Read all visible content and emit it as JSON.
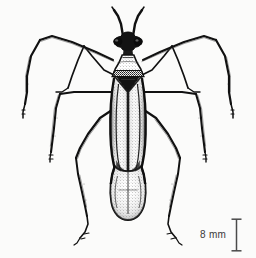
{
  "figure": {
    "type": "scientific-line-drawing",
    "background_color": "#fbfbfa",
    "ink_color": "#111111",
    "view": "dorsal"
  },
  "scale_bar": {
    "label": "8 mm",
    "value": 8,
    "unit": "mm",
    "text_color": "#3a3a3a",
    "bar_color": "#4a4a4a",
    "orientation": "vertical",
    "cap_style": "i-beam",
    "position": "bottom-right"
  },
  "anatomy": {
    "parts": [
      "antennae",
      "head",
      "compound-eyes",
      "pronotum",
      "scutellum",
      "hemelytra",
      "clavus",
      "corium",
      "membrane",
      "abdomen",
      "foreleg-left",
      "foreleg-right",
      "midleg-left",
      "midleg-right",
      "hindleg-left",
      "hindleg-right",
      "tarsi"
    ]
  }
}
